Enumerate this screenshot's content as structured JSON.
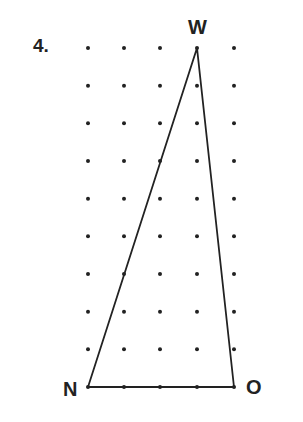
{
  "problem": {
    "number": "4."
  },
  "grid": {
    "columns": 5,
    "rows": 10
  },
  "triangle": {
    "vertices": [
      {
        "name": "W",
        "col": 3,
        "row": 0
      },
      {
        "name": "N",
        "col": 0,
        "row": 9
      },
      {
        "name": "O",
        "col": 4,
        "row": 9
      }
    ]
  },
  "labels": {
    "w": "W",
    "n": "N",
    "o": "O"
  },
  "colors": {
    "ink": "#222222",
    "background": "#ffffff"
  }
}
